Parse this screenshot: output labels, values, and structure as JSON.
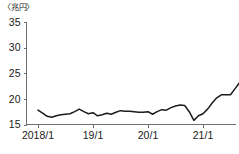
{
  "chart_data": {
    "type": "line",
    "title": "",
    "subtitle": "",
    "unit_label": "〈兆円〉",
    "xlabel": "",
    "ylabel": "",
    "ylim": [
      15,
      35
    ],
    "y_ticks": [
      15,
      20,
      25,
      30,
      35
    ],
    "x_tick_labels": [
      "2018/1",
      "19/1",
      "20/1",
      "21/1"
    ],
    "x_tick_values": [
      "2018-01",
      "2019-01",
      "2020-01",
      "2021-01"
    ],
    "grid": false,
    "legend": null,
    "line_color": "#1c1c1c",
    "axis_color": "#6e6e6e",
    "series": [
      {
        "name": "値",
        "x": [
          "2018-01",
          "2018-02",
          "2018-03",
          "2018-04",
          "2018-05",
          "2018-06",
          "2018-07",
          "2018-08",
          "2018-09",
          "2018-10",
          "2018-11",
          "2018-12",
          "2019-01",
          "2019-02",
          "2019-03",
          "2019-04",
          "2019-05",
          "2019-06",
          "2019-07",
          "2019-08",
          "2019-09",
          "2019-10",
          "2019-11",
          "2019-12",
          "2020-01",
          "2020-02",
          "2020-03",
          "2020-04",
          "2020-05",
          "2020-06",
          "2020-07",
          "2020-08",
          "2020-09",
          "2020-10",
          "2020-11",
          "2020-12",
          "2021-01",
          "2021-02",
          "2021-03",
          "2021-04",
          "2021-05",
          "2021-06",
          "2021-07",
          "2021-08",
          "2021-09",
          "2021-10"
        ],
        "values": [
          17.8,
          17.2,
          16.6,
          16.4,
          16.7,
          16.9,
          17.0,
          17.1,
          17.5,
          18.0,
          17.5,
          17.1,
          17.3,
          16.7,
          16.9,
          17.2,
          17.0,
          17.4,
          17.7,
          17.6,
          17.6,
          17.5,
          17.4,
          17.4,
          17.5,
          17.0,
          17.5,
          17.9,
          17.8,
          18.3,
          18.6,
          18.8,
          18.7,
          17.5,
          15.8,
          16.7,
          17.1,
          18.0,
          19.2,
          20.2,
          20.8,
          20.8,
          20.8,
          22.0,
          23.2,
          24.0
        ]
      }
    ],
    "series_extension": {
      "note_x": [
        "2021-11",
        "2021-12",
        "2022-01",
        "2022-02",
        "2022-03",
        "2022-04"
      ],
      "note_values": [
        25.0,
        26.0,
        27.5,
        27.2,
        28.6,
        30.4
      ]
    }
  }
}
